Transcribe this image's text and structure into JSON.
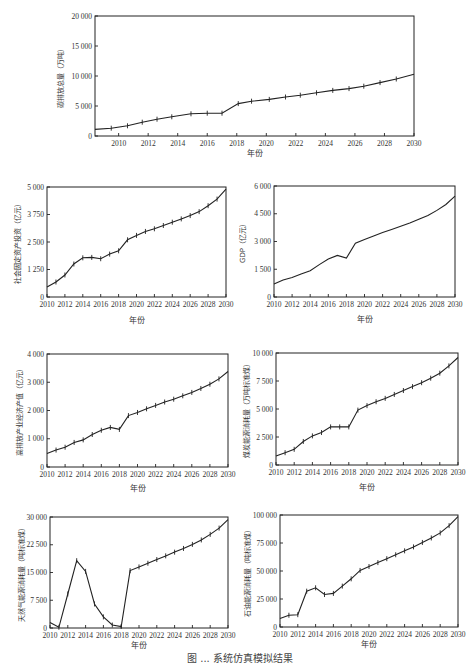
{
  "figure_caption_partial": "图 ... 系统仿真模拟结果",
  "chart_data": [
    {
      "id": "carbon",
      "type": "line",
      "title": "",
      "xlabel": "年份",
      "ylabel": "碳排放总量（万吨）",
      "xlim": [
        2008.4,
        2030
      ],
      "ylim": [
        0,
        20000
      ],
      "xticks": [
        2010,
        2012,
        2014,
        2016,
        2018,
        2020,
        2022,
        2024,
        2026,
        2028,
        2030
      ],
      "yticks": [
        0,
        5000,
        10000,
        15000,
        20000
      ],
      "ytick_labels": [
        "0",
        "5 000",
        "10 000",
        "15 000",
        "20 000"
      ],
      "x": [
        2008.4,
        2009.5,
        2010.6,
        2011.6,
        2012.6,
        2013.6,
        2014.9,
        2016,
        2017,
        2018.1,
        2019,
        2020.2,
        2021.3,
        2022.3,
        2023.4,
        2024.5,
        2025.6,
        2026.6,
        2027.7,
        2028.8,
        2030
      ],
      "values": [
        1100,
        1300,
        1700,
        2300,
        2800,
        3200,
        3700,
        3800,
        3800,
        5400,
        5800,
        6100,
        6500,
        6800,
        7200,
        7600,
        7900,
        8300,
        8900,
        9500,
        10300
      ],
      "markers": true,
      "grid": false,
      "legend": null
    },
    {
      "id": "fixed_investment",
      "type": "line",
      "xlabel": "年份",
      "ylabel": "社会固定资产投资（亿元）",
      "xlim": [
        2010,
        2030
      ],
      "ylim": [
        0,
        5000
      ],
      "xticks": [
        2010,
        2012,
        2014,
        2016,
        2018,
        2020,
        2022,
        2024,
        2026,
        2028,
        2030
      ],
      "yticks": [
        0,
        1250,
        2500,
        3750,
        5000
      ],
      "ytick_labels": [
        "0",
        "1 250",
        "2 500",
        "3 750",
        "5 000"
      ],
      "x": [
        2010,
        2011,
        2012,
        2013,
        2014,
        2015,
        2016,
        2017,
        2018,
        2019,
        2020,
        2021,
        2022,
        2023,
        2024,
        2025,
        2026,
        2027,
        2028,
        2029,
        2030
      ],
      "values": [
        450,
        680,
        1000,
        1500,
        1780,
        1800,
        1740,
        1950,
        2100,
        2600,
        2800,
        2980,
        3100,
        3250,
        3400,
        3550,
        3700,
        3880,
        4150,
        4450,
        4900
      ],
      "markers": true,
      "grid": false
    },
    {
      "id": "gdp",
      "type": "line",
      "xlabel": "年份",
      "ylabel": "GDP（亿元）",
      "xlim": [
        2010,
        2030
      ],
      "ylim": [
        0,
        6000
      ],
      "xticks": [
        2010,
        2012,
        2014,
        2016,
        2018,
        2020,
        2022,
        2024,
        2026,
        2028,
        2030
      ],
      "yticks": [
        0,
        1500,
        3000,
        4500,
        6000
      ],
      "ytick_labels": [
        "0",
        "1 500",
        "3 000",
        "4 500",
        "6 000"
      ],
      "x": [
        2010,
        2011,
        2012,
        2013,
        2014,
        2015,
        2016,
        2017,
        2018,
        2019,
        2020,
        2021,
        2022,
        2023,
        2024,
        2025,
        2026,
        2027,
        2028,
        2029,
        2030
      ],
      "values": [
        700,
        920,
        1050,
        1250,
        1420,
        1750,
        2050,
        2250,
        2100,
        2900,
        3100,
        3300,
        3480,
        3650,
        3820,
        4000,
        4200,
        4400,
        4680,
        5000,
        5450
      ],
      "markers": false,
      "grid": false
    },
    {
      "id": "high_emission_output",
      "type": "line",
      "xlabel": "年份",
      "ylabel": "高排放产业经济产值（亿元）",
      "xlim": [
        2010,
        2030
      ],
      "ylim": [
        0,
        4000
      ],
      "xticks": [
        2010,
        2012,
        2014,
        2016,
        2018,
        2020,
        2022,
        2024,
        2026,
        2028,
        2030
      ],
      "yticks": [
        0,
        1000,
        2000,
        3000,
        4000
      ],
      "ytick_labels": [
        "0",
        "1 000",
        "2 000",
        "3 000",
        "4 000"
      ],
      "x": [
        2010,
        2011,
        2012,
        2013,
        2014,
        2015,
        2016,
        2017,
        2018,
        2019,
        2020,
        2021,
        2022,
        2023,
        2024,
        2025,
        2026,
        2027,
        2028,
        2029,
        2030
      ],
      "values": [
        480,
        600,
        700,
        870,
        960,
        1150,
        1300,
        1400,
        1330,
        1820,
        1930,
        2060,
        2180,
        2300,
        2400,
        2520,
        2640,
        2780,
        2930,
        3120,
        3380
      ],
      "markers": true,
      "grid": false
    },
    {
      "id": "coal_consumption",
      "type": "line",
      "xlabel": "年份",
      "ylabel": "煤炭能源消耗量（万吨标准煤）",
      "xlim": [
        2010,
        2030
      ],
      "ylim": [
        0,
        10000
      ],
      "xticks": [
        2010,
        2012,
        2014,
        2016,
        2018,
        2020,
        2022,
        2024,
        2026,
        2028,
        2030
      ],
      "yticks": [
        0,
        2500,
        5000,
        7500,
        10000
      ],
      "ytick_labels": [
        "0",
        "2 500",
        "5 000",
        "7 500",
        "10 000"
      ],
      "x": [
        2010,
        2011,
        2012,
        2013,
        2014,
        2015,
        2016,
        2017,
        2018,
        2019,
        2020,
        2021,
        2022,
        2023,
        2024,
        2025,
        2026,
        2027,
        2028,
        2029,
        2030
      ],
      "values": [
        800,
        1100,
        1400,
        2100,
        2600,
        2900,
        3400,
        3400,
        3400,
        4900,
        5300,
        5650,
        5950,
        6300,
        6650,
        7000,
        7350,
        7750,
        8200,
        8850,
        9600
      ],
      "markers": true,
      "grid": false
    },
    {
      "id": "natural_gas_consumption",
      "type": "line",
      "xlabel": "年份",
      "ylabel": "天然气能源消耗量（吨标准煤）",
      "xlim": [
        2010,
        2030
      ],
      "ylim": [
        0,
        30000
      ],
      "xticks": [
        2010,
        2012,
        2014,
        2016,
        2018,
        2020,
        2022,
        2024,
        2026,
        2028,
        2030
      ],
      "yticks": [
        0,
        7500,
        15000,
        22500,
        30000
      ],
      "ytick_labels": [
        "0",
        "7 500",
        "15 000",
        "22 500",
        "30 000"
      ],
      "x": [
        2010,
        2011,
        2012,
        2013,
        2014,
        2015,
        2016,
        2017,
        2018,
        2019,
        2020,
        2021,
        2022,
        2023,
        2024,
        2025,
        2026,
        2027,
        2028,
        2029,
        2030
      ],
      "values": [
        1500,
        200,
        9200,
        18200,
        15300,
        6500,
        3000,
        800,
        400,
        15500,
        16500,
        17500,
        18500,
        19500,
        20500,
        21500,
        22600,
        23800,
        25300,
        27000,
        29300
      ],
      "markers": true,
      "grid": false
    },
    {
      "id": "oil_consumption",
      "type": "line",
      "xlabel": "年份",
      "ylabel": "石油能源消耗量（吨标准煤）",
      "xlim": [
        2010,
        2030
      ],
      "ylim": [
        0,
        100000
      ],
      "xticks": [
        2010,
        2012,
        2014,
        2016,
        2018,
        2020,
        2022,
        2024,
        2026,
        2028,
        2030
      ],
      "yticks": [
        0,
        25000,
        50000,
        75000,
        100000
      ],
      "ytick_labels": [
        "0",
        "25 000",
        "50 000",
        "75 000",
        "100 000"
      ],
      "x": [
        2010,
        2011,
        2012,
        2013,
        2014,
        2015,
        2016,
        2017,
        2018,
        2019,
        2020,
        2021,
        2022,
        2023,
        2024,
        2025,
        2026,
        2027,
        2028,
        2029,
        2030
      ],
      "values": [
        7500,
        10500,
        11000,
        32000,
        35000,
        29000,
        30000,
        36500,
        43000,
        50500,
        54000,
        57500,
        61000,
        64500,
        68000,
        71500,
        75500,
        79500,
        84000,
        90500,
        98500
      ],
      "markers": true,
      "grid": false
    }
  ],
  "layout": {
    "panels": [
      {
        "id": "carbon",
        "x0": 95,
        "x1": 414,
        "y0": 16,
        "y1": 136,
        "xlab_y": 156,
        "ylab_x": 63
      },
      {
        "id": "fixed_investment",
        "x0": 47,
        "x1": 226,
        "y0": 187,
        "y1": 297,
        "xlab_y": 323,
        "ylab_x": 20
      },
      {
        "id": "gdp",
        "x0": 274,
        "x1": 455,
        "y0": 186,
        "y1": 297,
        "xlab_y": 322,
        "ylab_x": 245
      },
      {
        "id": "high_emission_output",
        "x0": 47,
        "x1": 228,
        "y0": 354,
        "y1": 467,
        "xlab_y": 491,
        "ylab_x": 22
      },
      {
        "id": "coal_consumption",
        "x0": 276,
        "x1": 458,
        "y0": 353,
        "y1": 465,
        "xlab_y": 490,
        "ylab_x": 249
      },
      {
        "id": "natural_gas_consumption",
        "x0": 50,
        "x1": 228,
        "y0": 517,
        "y1": 628,
        "xlab_y": 648,
        "ylab_x": 24
      },
      {
        "id": "oil_consumption",
        "x0": 280,
        "x1": 458,
        "y0": 515,
        "y1": 627,
        "xlab_y": 647,
        "ylab_x": 250
      }
    ]
  }
}
